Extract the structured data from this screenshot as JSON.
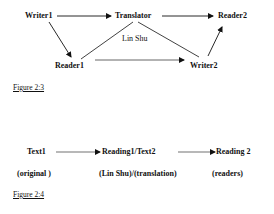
{
  "figure_2_3": {
    "caption": "Figure 2:3",
    "nodes": {
      "writer1": "Writer1",
      "translator": "Translator",
      "reader2": "Reader2",
      "lin_shu": "Lin Shu",
      "reader1": "Reader1",
      "writer2": "Writer2"
    },
    "edges": [
      {
        "from": "Writer1",
        "to": "Translator",
        "arrow": true
      },
      {
        "from": "Translator",
        "to": "Reader2",
        "arrow": true
      },
      {
        "from": "Writer1",
        "to": "Reader1",
        "arrow": true
      },
      {
        "from": "Reader1",
        "to": "Translator",
        "arrow": false
      },
      {
        "from": "Translator",
        "to": "Writer2",
        "arrow": false
      },
      {
        "from": "Reader1",
        "to": "Writer2",
        "arrow": true
      },
      {
        "from": "Writer2",
        "to": "Reader2",
        "arrow": true
      }
    ]
  },
  "figure_2_4": {
    "caption": "Figure 2:4",
    "row1": {
      "text1": "Text1",
      "reading1_text2": "Reading1/Text2",
      "reading2": "Reading 2"
    },
    "row2": {
      "original": "(original )",
      "lin_shu_translation": "(Lin Shu)/(translation)",
      "readers": "(readers)"
    }
  }
}
